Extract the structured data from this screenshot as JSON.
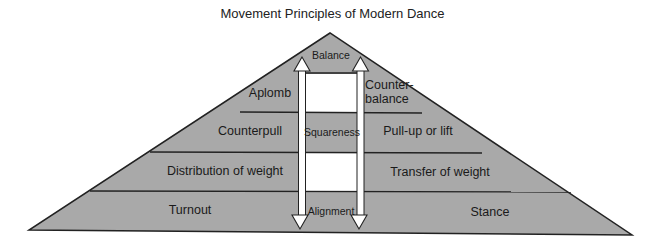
{
  "title": "Movement Principles of Modern Dance",
  "colors": {
    "fill": "#a9a9a9",
    "stroke": "#222222",
    "center_white": "#ffffff",
    "text": "#1a1a1a"
  },
  "center_column": {
    "apex": "Balance",
    "level3": "Squareness",
    "level5": "Alignment"
  },
  "levels": [
    {
      "index": 1,
      "left": "Balance",
      "right": ""
    },
    {
      "index": 2,
      "left": "Aplomb",
      "right": "Counter-balance",
      "right_line1": "Counter-",
      "right_line2": "balance"
    },
    {
      "index": 3,
      "left": "Counterpull",
      "center": "Squareness",
      "right": "Pull-up or lift"
    },
    {
      "index": 4,
      "left": "Distribution of weight",
      "right": "Transfer of weight"
    },
    {
      "index": 5,
      "left": "Turnout",
      "center": "Alignment",
      "right": "Stance"
    }
  ],
  "arrows": [
    {
      "name": "left-arrow",
      "direction": "bidirectional"
    },
    {
      "name": "right-arrow",
      "direction": "bidirectional"
    }
  ]
}
